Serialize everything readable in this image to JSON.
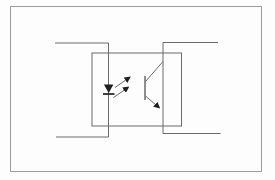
{
  "diagram": {
    "type": "circuit-schematic",
    "symbols": {
      "package": "optocoupler-package-outline",
      "led": "led-symbol",
      "light": "light-emission-arrows",
      "transistor": "phototransistor-symbol"
    }
  },
  "colors": {
    "background": "#fdfdfd",
    "frame": "#9c9c9c",
    "line": "#6a6a6a",
    "symbol": "#1f1f1f"
  }
}
